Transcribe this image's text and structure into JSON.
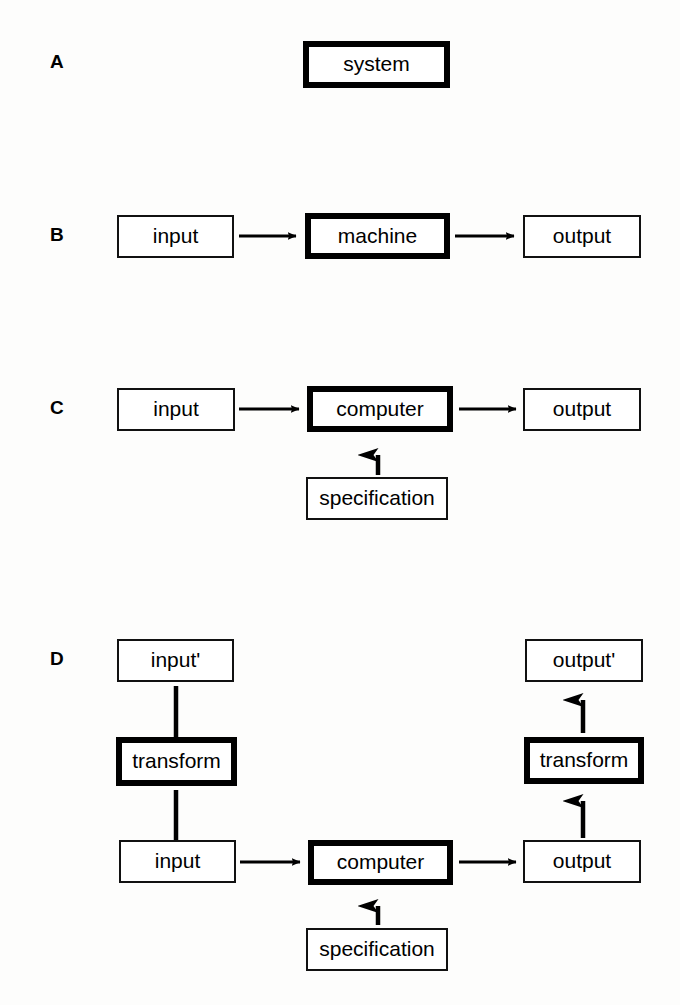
{
  "figure": {
    "background_color": "#fdfdfc",
    "line_color": "#000000",
    "panels": [
      {
        "letter": "A",
        "nodes": [
          {
            "name": "system",
            "label": "system",
            "emphasis": "bold"
          }
        ],
        "arrows": []
      },
      {
        "letter": "B",
        "nodes": [
          {
            "name": "input",
            "label": "input",
            "emphasis": "thin"
          },
          {
            "name": "machine",
            "label": "machine",
            "emphasis": "bold"
          },
          {
            "name": "output",
            "label": "output",
            "emphasis": "thin"
          }
        ],
        "arrows": [
          {
            "from": "input",
            "to": "machine",
            "direction": "right"
          },
          {
            "from": "machine",
            "to": "output",
            "direction": "right"
          }
        ]
      },
      {
        "letter": "C",
        "nodes": [
          {
            "name": "input",
            "label": "input",
            "emphasis": "thin"
          },
          {
            "name": "computer",
            "label": "computer",
            "emphasis": "bold"
          },
          {
            "name": "output",
            "label": "output",
            "emphasis": "thin"
          },
          {
            "name": "specification",
            "label": "specification",
            "emphasis": "thin"
          }
        ],
        "arrows": [
          {
            "from": "input",
            "to": "computer",
            "direction": "right"
          },
          {
            "from": "computer",
            "to": "output",
            "direction": "right"
          },
          {
            "from": "specification",
            "to": "computer",
            "direction": "up"
          }
        ]
      },
      {
        "letter": "D",
        "nodes": [
          {
            "name": "input-prime",
            "label": "input'",
            "emphasis": "thin"
          },
          {
            "name": "transform-left",
            "label": "transform",
            "emphasis": "bold"
          },
          {
            "name": "input",
            "label": "input",
            "emphasis": "thin"
          },
          {
            "name": "computer",
            "label": "computer",
            "emphasis": "bold"
          },
          {
            "name": "output",
            "label": "output",
            "emphasis": "thin"
          },
          {
            "name": "transform-right",
            "label": "transform",
            "emphasis": "bold"
          },
          {
            "name": "output-prime",
            "label": "output'",
            "emphasis": "thin"
          },
          {
            "name": "specification",
            "label": "specification",
            "emphasis": "thin"
          }
        ],
        "arrows": [
          {
            "from": "input-prime",
            "to": "transform-left",
            "direction": "down"
          },
          {
            "from": "transform-left",
            "to": "input",
            "direction": "down"
          },
          {
            "from": "input",
            "to": "computer",
            "direction": "right"
          },
          {
            "from": "computer",
            "to": "output",
            "direction": "right"
          },
          {
            "from": "output",
            "to": "transform-right",
            "direction": "up"
          },
          {
            "from": "transform-right",
            "to": "output-prime",
            "direction": "up"
          },
          {
            "from": "specification",
            "to": "computer",
            "direction": "up"
          }
        ]
      }
    ]
  },
  "labels": {
    "panel_a": "A",
    "panel_b": "B",
    "panel_c": "C",
    "panel_d": "D",
    "system": "system",
    "input": "input",
    "machine": "machine",
    "output": "output",
    "computer": "computer",
    "specification": "specification",
    "input_prime": "input'",
    "output_prime": "output'",
    "transform": "transform"
  }
}
